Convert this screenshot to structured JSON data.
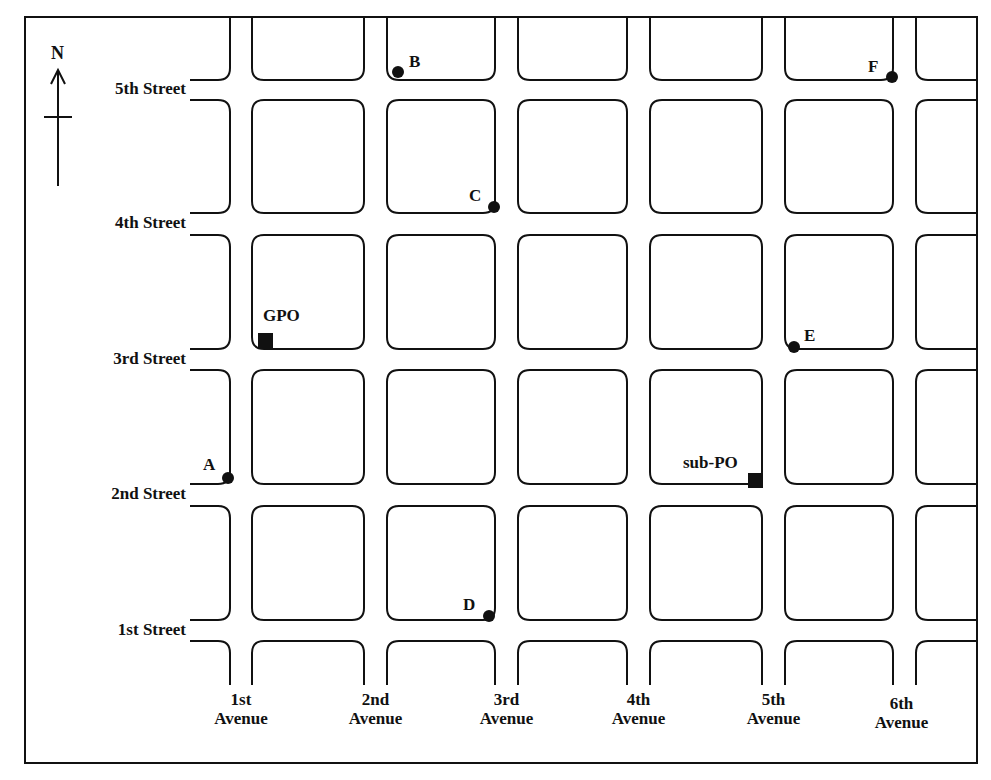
{
  "compass": {
    "label": "N"
  },
  "streets": [
    {
      "label": "5th Street",
      "gap": [
        80,
        100
      ]
    },
    {
      "label": "4th Street",
      "gap": [
        213,
        235
      ]
    },
    {
      "label": "3rd Street",
      "gap": [
        349,
        370
      ]
    },
    {
      "label": "2nd Street",
      "gap": [
        484,
        506
      ]
    },
    {
      "label": "1st Street",
      "gap": [
        620,
        641
      ]
    }
  ],
  "avenues": [
    {
      "line1": "1st",
      "line2": "Avenue",
      "gap": [
        230,
        252
      ]
    },
    {
      "line1": "2nd",
      "line2": "Avenue",
      "gap": [
        364,
        387
      ]
    },
    {
      "line1": "3rd",
      "line2": "Avenue",
      "gap": [
        495,
        518
      ]
    },
    {
      "line1": "4th",
      "line2": "Avenue",
      "gap": [
        627,
        650
      ]
    },
    {
      "line1": "5th",
      "line2": "Avenue",
      "gap": [
        762,
        785
      ]
    },
    {
      "line1": "6th",
      "line2": "Avenue",
      "gap": [
        893,
        916
      ]
    }
  ],
  "points": [
    {
      "label": "A",
      "x": 228,
      "y": 478,
      "lx": 203,
      "ly": 455
    },
    {
      "label": "B",
      "x": 398,
      "y": 72,
      "lx": 409,
      "ly": 52
    },
    {
      "label": "C",
      "x": 494,
      "y": 207,
      "lx": 469,
      "ly": 186
    },
    {
      "label": "D",
      "x": 489,
      "y": 616,
      "lx": 463,
      "ly": 595
    },
    {
      "label": "E",
      "x": 794,
      "y": 347,
      "lx": 804,
      "ly": 326
    },
    {
      "label": "F",
      "x": 892,
      "y": 77,
      "lx": 868,
      "ly": 57
    }
  ],
  "offices": [
    {
      "label": "GPO",
      "x": 258,
      "y": 333,
      "lx": 263,
      "ly": 306
    },
    {
      "label": "sub-PO",
      "x": 748,
      "y": 473,
      "lx": 683,
      "ly": 453
    }
  ],
  "colors": {
    "ink": "#111111",
    "background": "#ffffff"
  }
}
